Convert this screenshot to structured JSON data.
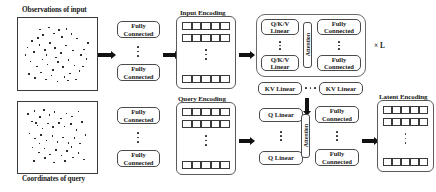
{
  "figure": {
    "type": "architecture-diagram"
  },
  "inputs": {
    "observations": {
      "caption": "Observations of input",
      "points": [
        [
          0.14,
          0.3
        ],
        [
          0.26,
          0.12
        ],
        [
          0.3,
          0.21
        ],
        [
          0.38,
          0.09
        ],
        [
          0.45,
          0.18
        ],
        [
          0.52,
          0.13
        ],
        [
          0.57,
          0.24
        ],
        [
          0.63,
          0.11
        ],
        [
          0.7,
          0.19
        ],
        [
          0.78,
          0.26
        ],
        [
          0.08,
          0.4
        ],
        [
          0.17,
          0.47
        ],
        [
          0.25,
          0.36
        ],
        [
          0.33,
          0.44
        ],
        [
          0.4,
          0.33
        ],
        [
          0.47,
          0.41
        ],
        [
          0.55,
          0.49
        ],
        [
          0.62,
          0.37
        ],
        [
          0.72,
          0.45
        ],
        [
          0.83,
          0.52
        ],
        [
          0.88,
          0.43
        ],
        [
          0.91,
          0.58
        ],
        [
          0.12,
          0.62
        ],
        [
          0.21,
          0.7
        ],
        [
          0.29,
          0.59
        ],
        [
          0.36,
          0.67
        ],
        [
          0.44,
          0.75
        ],
        [
          0.51,
          0.63
        ],
        [
          0.58,
          0.71
        ],
        [
          0.66,
          0.6
        ],
        [
          0.74,
          0.68
        ],
        [
          0.81,
          0.77
        ],
        [
          0.1,
          0.82
        ],
        [
          0.19,
          0.88
        ],
        [
          0.27,
          0.79
        ],
        [
          0.34,
          0.9
        ],
        [
          0.42,
          0.84
        ],
        [
          0.5,
          0.93
        ],
        [
          0.6,
          0.86
        ],
        [
          0.68,
          0.81
        ],
        [
          0.76,
          0.9
        ],
        [
          0.86,
          0.7
        ],
        [
          0.05,
          0.52
        ],
        [
          0.93,
          0.33
        ],
        [
          0.23,
          0.25
        ],
        [
          0.48,
          0.56
        ],
        [
          0.65,
          0.92
        ],
        [
          0.35,
          0.52
        ]
      ]
    },
    "query": {
      "caption": "Coordinates of query",
      "points": [
        [
          0.09,
          0.13
        ],
        [
          0.18,
          0.08
        ],
        [
          0.26,
          0.18
        ],
        [
          0.31,
          0.07
        ],
        [
          0.39,
          0.15
        ],
        [
          0.46,
          0.1
        ],
        [
          0.55,
          0.2
        ],
        [
          0.63,
          0.12
        ],
        [
          0.71,
          0.17
        ],
        [
          0.8,
          0.09
        ],
        [
          0.14,
          0.25
        ],
        [
          0.22,
          0.31
        ],
        [
          0.2,
          0.27
        ],
        [
          0.29,
          0.36
        ],
        [
          0.37,
          0.28
        ],
        [
          0.44,
          0.34
        ],
        [
          0.52,
          0.27
        ],
        [
          0.6,
          0.33
        ],
        [
          0.69,
          0.29
        ],
        [
          0.77,
          0.38
        ],
        [
          0.85,
          0.26
        ],
        [
          0.11,
          0.44
        ],
        [
          0.19,
          0.52
        ],
        [
          0.27,
          0.46
        ],
        [
          0.35,
          0.55
        ],
        [
          0.43,
          0.48
        ],
        [
          0.5,
          0.57
        ],
        [
          0.58,
          0.5
        ],
        [
          0.66,
          0.59
        ],
        [
          0.74,
          0.51
        ],
        [
          0.82,
          0.6
        ],
        [
          0.9,
          0.46
        ],
        [
          0.15,
          0.66
        ],
        [
          0.24,
          0.74
        ],
        [
          0.32,
          0.68
        ],
        [
          0.4,
          0.77
        ],
        [
          0.48,
          0.7
        ],
        [
          0.56,
          0.79
        ],
        [
          0.64,
          0.72
        ],
        [
          0.72,
          0.82
        ],
        [
          0.8,
          0.75
        ],
        [
          0.88,
          0.85
        ],
        [
          0.17,
          0.88
        ],
        [
          0.45,
          0.9
        ],
        [
          0.61,
          0.88
        ],
        [
          0.33,
          0.83
        ],
        [
          0.25,
          0.6
        ],
        [
          0.7,
          0.65
        ]
      ]
    }
  },
  "encoders": {
    "input_fc": {
      "top_label_line1": "Fully",
      "top_label_line2": "Connected",
      "bottom_label_line1": "Fully",
      "bottom_label_line2": "Connected",
      "ellipsis": "vertical"
    },
    "query_fc": {
      "top_label_line1": "Fully",
      "top_label_line2": "Connected",
      "bottom_label_line1": "Fully",
      "bottom_label_line2": "Connected",
      "ellipsis": "vertical"
    }
  },
  "encodings": {
    "input": {
      "title": "Input Encoding",
      "rows": 3,
      "cols": 5
    },
    "query": {
      "title": "Query Encoding",
      "rows": 3,
      "cols": 5
    },
    "latent": {
      "title": "Latent Encoding",
      "rows": 3,
      "cols": 5
    }
  },
  "transformer_block": {
    "repeat_label": "× L",
    "qkv_top_line1": "Q/K/V",
    "qkv_top_line2": "Linear",
    "qkv_bottom_line1": "Q/K/V",
    "qkv_bottom_line2": "Linear",
    "attention_label": "Attention",
    "fc_top_line1": "Fully",
    "fc_top_line2": "Connected",
    "fc_bottom_line1": "Fully",
    "fc_bottom_line2": "Connected"
  },
  "kv_row": {
    "left_label": "KV Linear",
    "right_label": "KV Linear",
    "ellipsis": "horizontal"
  },
  "cross_attention": {
    "q_top_label": "Q Linear",
    "q_bottom_label": "Q Linear",
    "attention_label": "Attention",
    "fc_top_line1": "Fully",
    "fc_top_line2": "Connected",
    "fc_bottom_line1": "Fully",
    "fc_bottom_line2": "Connected"
  },
  "colors": {
    "ink": "#1a1a1a",
    "stroke": "#4a4a4a",
    "arrow": "#111111",
    "background": "#ffffff"
  }
}
